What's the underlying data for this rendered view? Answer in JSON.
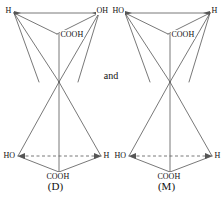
{
  "figure": {
    "conjunction": "and",
    "stroke_color": "#555555",
    "text_color": "#111111",
    "background_color": "#ffffff"
  },
  "structures": [
    {
      "id": "structure-d",
      "caption": "(D)",
      "upper_tetrahedron": {
        "top_left_label": "H",
        "top_right_label": "OH",
        "inner_apex_label": "COOH"
      },
      "lower_tetrahedron": {
        "left_label": "HO",
        "right_label": "H",
        "bottom_label": "COOH"
      }
    },
    {
      "id": "structure-m",
      "caption": "(M)",
      "upper_tetrahedron": {
        "top_left_label": "HO",
        "top_right_label": "H",
        "inner_apex_label": "COOH"
      },
      "lower_tetrahedron": {
        "left_label": "HO",
        "right_label": "H",
        "bottom_label": "COOH"
      }
    }
  ]
}
